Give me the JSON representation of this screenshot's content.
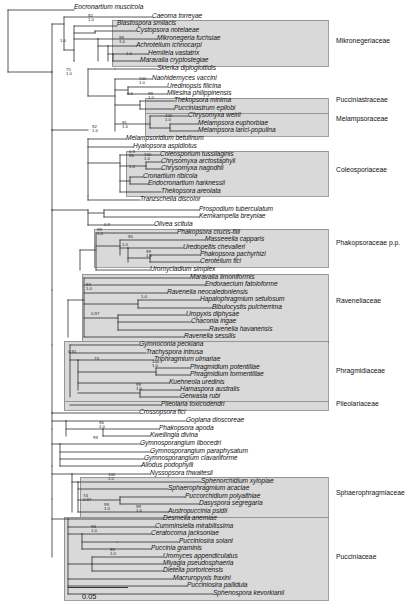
{
  "figure": {
    "type": "phylogenetic-tree",
    "scale_bar": {
      "label": "0.05",
      "length_px": 60
    }
  },
  "taxa": [
    {
      "name": "Eocronartium muscicola",
      "x": 74,
      "y": 8
    },
    {
      "name": "Caeoma torreyae",
      "x": 152,
      "y": 17
    },
    {
      "name": "Blastospora smilacis",
      "x": 117,
      "y": 24
    },
    {
      "name": "Cystopsora notelaeae",
      "x": 136,
      "y": 31
    },
    {
      "name": "Mikronegeria fuchsiae",
      "x": 157,
      "y": 39
    },
    {
      "name": "Achrotelium ichnocarpi",
      "x": 136,
      "y": 46
    },
    {
      "name": "Hemileia vastatrix",
      "x": 148,
      "y": 54
    },
    {
      "name": "Maravalia cryptostegiae",
      "x": 140,
      "y": 61
    },
    {
      "name": "Skierka diploglottidis",
      "x": 157,
      "y": 69
    },
    {
      "name": "Naohidemyces vaccini",
      "x": 152,
      "y": 79
    },
    {
      "name": "Uredinopsis filicina",
      "x": 167,
      "y": 87
    },
    {
      "name": "Milesina philippinensis",
      "x": 167,
      "y": 94
    },
    {
      "name": "Thekopsora minima",
      "x": 174,
      "y": 101
    },
    {
      "name": "Pucciniastrum epilobi",
      "x": 174,
      "y": 109
    },
    {
      "name": "Chrysomyxa weirii",
      "x": 188,
      "y": 116
    },
    {
      "name": "Melampsora euphorbiae",
      "x": 198,
      "y": 124
    },
    {
      "name": "Melampsora larici-populina",
      "x": 198,
      "y": 131
    },
    {
      "name": "Melampsoridium betulinum",
      "x": 126,
      "y": 139
    },
    {
      "name": "Hyalopsora aspidiotus",
      "x": 133,
      "y": 147
    },
    {
      "name": "Coleosporium tussilaginis",
      "x": 160,
      "y": 155
    },
    {
      "name": "Chrysomyxa arctostaphyli",
      "x": 161,
      "y": 162
    },
    {
      "name": "Chrysomyxa nagodhii",
      "x": 161,
      "y": 169
    },
    {
      "name": "Cronartium ribicola",
      "x": 143,
      "y": 177
    },
    {
      "name": "Endocronartium harknessii",
      "x": 148,
      "y": 184
    },
    {
      "name": "Thekopsora areolata",
      "x": 161,
      "y": 192
    },
    {
      "name": "Tranzschelia discolor",
      "x": 140,
      "y": 200
    },
    {
      "name": "Prospodium tuberculatum",
      "x": 199,
      "y": 210
    },
    {
      "name": "Kernkampella breyniae",
      "x": 199,
      "y": 217
    },
    {
      "name": "Olivea scitula",
      "x": 154,
      "y": 225
    },
    {
      "name": "Phakopsora crucis-filii",
      "x": 177,
      "y": 233
    },
    {
      "name": "Masseeella capparis",
      "x": 205,
      "y": 240
    },
    {
      "name": "Uredopeltis chevalieri",
      "x": 183,
      "y": 248
    },
    {
      "name": "Phakopsora pachyrhizi",
      "x": 200,
      "y": 255
    },
    {
      "name": "Cerotelium fici",
      "x": 200,
      "y": 262
    },
    {
      "name": "Uromycladium simplex",
      "x": 150,
      "y": 270
    },
    {
      "name": "Maravalia limoniformis",
      "x": 190,
      "y": 278
    },
    {
      "name": "Endoraecium fatoloforme",
      "x": 205,
      "y": 285
    },
    {
      "name": "Ravenelia neocaledoniensis",
      "x": 167,
      "y": 293
    },
    {
      "name": "Hapalophragmium setulosum",
      "x": 200,
      "y": 300
    },
    {
      "name": "Bibulocystis pulcherrima",
      "x": 212,
      "y": 308
    },
    {
      "name": "Uropyxis diphysae",
      "x": 186,
      "y": 315
    },
    {
      "name": "Chaconia ingae",
      "x": 191,
      "y": 322
    },
    {
      "name": "Ravenelia havanensis",
      "x": 209,
      "y": 330
    },
    {
      "name": "Ravenelia sessilis",
      "x": 184,
      "y": 337
    },
    {
      "name": "Gymnoconia peckiana",
      "x": 139,
      "y": 345
    },
    {
      "name": "Trachyspora intrusa",
      "x": 146,
      "y": 353
    },
    {
      "name": "Triphragmium ulmariae",
      "x": 154,
      "y": 360
    },
    {
      "name": "Phragmidium potentillae",
      "x": 190,
      "y": 368
    },
    {
      "name": "Phragmidium tormentillae",
      "x": 190,
      "y": 375
    },
    {
      "name": "Kuehneola uredinis",
      "x": 169,
      "y": 383
    },
    {
      "name": "Hamaspora australis",
      "x": 180,
      "y": 390
    },
    {
      "name": "Gerwasia rubi",
      "x": 180,
      "y": 397
    },
    {
      "name": "Pileolaria toxicodendri",
      "x": 161,
      "y": 405
    },
    {
      "name": "Crossopsora fici",
      "x": 139,
      "y": 413
    },
    {
      "name": "Goplana dioscoreae",
      "x": 186,
      "y": 421
    },
    {
      "name": "Phakopsora apoda",
      "x": 159,
      "y": 429
    },
    {
      "name": "Kweilingia divina",
      "x": 150,
      "y": 436
    },
    {
      "name": "Gymnosporangium libocedri",
      "x": 140,
      "y": 444
    },
    {
      "name": "Gymnosporangium paraphysatum",
      "x": 150,
      "y": 452
    },
    {
      "name": "Gymnosporangium clavariiforme",
      "x": 144,
      "y": 459
    },
    {
      "name": "Allodus podophylli",
      "x": 141,
      "y": 466
    },
    {
      "name": "Nyssopsora thwaitesii",
      "x": 150,
      "y": 474
    },
    {
      "name": "Sphenorchidium xylopiae",
      "x": 201,
      "y": 482
    },
    {
      "name": "Sphaerophragmium acaciae",
      "x": 168,
      "y": 489
    },
    {
      "name": "Puccorchidium polyalthiae",
      "x": 185,
      "y": 497
    },
    {
      "name": "Dasyspora segregaria",
      "x": 199,
      "y": 504
    },
    {
      "name": "Austropuccinia psidii",
      "x": 168,
      "y": 512
    },
    {
      "name": "Desmella anemiae",
      "x": 163,
      "y": 519
    },
    {
      "name": "Cumminsiella mirabilissima",
      "x": 155,
      "y": 527
    },
    {
      "name": "Ceratocoma jacksoniae",
      "x": 151,
      "y": 534
    },
    {
      "name": "Pucciniosira solani",
      "x": 179,
      "y": 542
    },
    {
      "name": "Puccinia graminis",
      "x": 151,
      "y": 549
    },
    {
      "name": "Uromyces appendiculatus",
      "x": 163,
      "y": 557
    },
    {
      "name": "Miyagia pseudosphaeria",
      "x": 163,
      "y": 564
    },
    {
      "name": "Dietelia portoricensis",
      "x": 163,
      "y": 571
    },
    {
      "name": "Macruropyxis fraxini",
      "x": 173,
      "y": 579
    },
    {
      "name": "Pucciniosira pallidula",
      "x": 187,
      "y": 586
    },
    {
      "name": "Sphenospora kevorkianii",
      "x": 213,
      "y": 594
    }
  ],
  "families": [
    {
      "label": "Mikronegeriaceae",
      "x": 336,
      "y": 41
    },
    {
      "label": "Pucciniastraceae",
      "x": 336,
      "y": 100
    },
    {
      "label": "Melampsoraceae",
      "x": 336,
      "y": 119
    },
    {
      "label": "Coleosporiaceae",
      "x": 336,
      "y": 170
    },
    {
      "label": "Phakopsoraceae p.p.",
      "x": 336,
      "y": 243
    },
    {
      "label": "Raveneliaceae",
      "x": 336,
      "y": 301
    },
    {
      "label": "Phragmidiaceae",
      "x": 336,
      "y": 371
    },
    {
      "label": "Pileolariaceae",
      "x": 336,
      "y": 404
    },
    {
      "label": "Sphaerophragmiaceae",
      "x": 336,
      "y": 493
    },
    {
      "label": "Pucciniaceae",
      "x": 336,
      "y": 557
    }
  ],
  "support_values": [
    {
      "top": "",
      "bottom": "1.0",
      "x": 60,
      "y": 44
    },
    {
      "top": "92",
      "bottom": "1.0",
      "x": 88,
      "y": 19
    },
    {
      "top": "99",
      "bottom": "1.0",
      "x": 119,
      "y": 41
    },
    {
      "top": "",
      "bottom": "1.0",
      "x": 126,
      "y": 57
    },
    {
      "top": "75",
      "bottom": "1.0",
      "x": 66,
      "y": 73
    },
    {
      "top": "100",
      "bottom": "1.0",
      "x": 139,
      "y": 82
    },
    {
      "top": "99",
      "bottom": "1.0",
      "x": 148,
      "y": 97
    },
    {
      "top": "0.6",
      "bottom": "",
      "x": 127,
      "y": 97
    },
    {
      "top": "100",
      "bottom": "1.0",
      "x": 165,
      "y": 119
    },
    {
      "top": "91",
      "bottom": "1.0",
      "x": 122,
      "y": 126
    },
    {
      "top": "92",
      "bottom": "1.0",
      "x": 92,
      "y": 130
    },
    {
      "top": "100",
      "bottom": "1.0",
      "x": 144,
      "y": 158
    },
    {
      "top": "0.9",
      "bottom": "96",
      "x": 129,
      "y": 155
    },
    {
      "top": "",
      "bottom": "1.0",
      "x": 129,
      "y": 170
    },
    {
      "top": "0.9",
      "bottom": "",
      "x": 104,
      "y": 228
    },
    {
      "top": "99",
      "bottom": "1.0",
      "x": 97,
      "y": 233
    },
    {
      "top": "90",
      "bottom": "",
      "x": 128,
      "y": 240
    },
    {
      "top": "1.0",
      "bottom": "",
      "x": 122,
      "y": 248
    },
    {
      "top": "99",
      "bottom": "1.0",
      "x": 146,
      "y": 255
    },
    {
      "top": "83",
      "bottom": "1.0",
      "x": 86,
      "y": 288
    },
    {
      "top": "",
      "bottom": "1.0",
      "x": 141,
      "y": 300
    },
    {
      "top": "0.97",
      "bottom": "",
      "x": 91,
      "y": 317
    },
    {
      "top": "0.91",
      "bottom": "",
      "x": 68,
      "y": 355
    },
    {
      "top": "100",
      "bottom": "1.0",
      "x": 152,
      "y": 365
    },
    {
      "top": "73",
      "bottom": "",
      "x": 94,
      "y": 362
    },
    {
      "top": "99",
      "bottom": "1.0",
      "x": 136,
      "y": 388
    },
    {
      "top": "96",
      "bottom": "1.0",
      "x": 99,
      "y": 426
    },
    {
      "top": "99",
      "bottom": "",
      "x": 93,
      "y": 441
    },
    {
      "top": "100",
      "bottom": "1.0",
      "x": 108,
      "y": 478
    },
    {
      "top": "74",
      "bottom": "0.97",
      "x": 83,
      "y": 499
    },
    {
      "top": "99",
      "bottom": "1.0",
      "x": 104,
      "y": 508
    },
    {
      "top": "99",
      "bottom": "1.0",
      "x": 136,
      "y": 510
    },
    {
      "top": "93",
      "bottom": "1.0",
      "x": 91,
      "y": 530
    },
    {
      "top": "89",
      "bottom": "1.0",
      "x": 110,
      "y": 553
    }
  ],
  "tree_lines": {
    "horizontal": [
      [
        8,
        10,
        74,
        10
      ],
      [
        8,
        10,
        8,
        72
      ],
      [
        8,
        72,
        52,
        72
      ],
      [
        52,
        24,
        52,
        72
      ],
      [
        52,
        24,
        152,
        24
      ],
      [
        64,
        17,
        64,
        50
      ],
      [
        64,
        17,
        152,
        17
      ],
      [
        74,
        26,
        74,
        64
      ],
      [
        74,
        26,
        117,
        26
      ],
      [
        95,
        33,
        95,
        57
      ],
      [
        95,
        33,
        136,
        33
      ],
      [
        108,
        41,
        108,
        49
      ],
      [
        108,
        41,
        157,
        41
      ],
      [
        108,
        49,
        136,
        49
      ],
      [
        113,
        56,
        113,
        64
      ],
      [
        113,
        56,
        148,
        56
      ],
      [
        113,
        64,
        140,
        64
      ],
      [
        52,
        72,
        52,
        130
      ],
      [
        115,
        71,
        115,
        200
      ],
      [
        115,
        71,
        157,
        71
      ],
      [
        52,
        130,
        88,
        130
      ],
      [
        88,
        96,
        88,
        160
      ],
      [
        88,
        96,
        115,
        96
      ],
      [
        128,
        81,
        128,
        111
      ],
      [
        128,
        81,
        152,
        81
      ],
      [
        140,
        89,
        140,
        96
      ],
      [
        140,
        89,
        167,
        89
      ],
      [
        140,
        96,
        167,
        96
      ],
      [
        150,
        103,
        150,
        111
      ],
      [
        150,
        103,
        174,
        103
      ],
      [
        150,
        111,
        174,
        111
      ],
      [
        152,
        118,
        152,
        133
      ],
      [
        152,
        118,
        188,
        118
      ],
      [
        176,
        126,
        176,
        133
      ],
      [
        176,
        126,
        198,
        126
      ],
      [
        176,
        133,
        198,
        133
      ],
      [
        122,
        141,
        122,
        194
      ],
      [
        122,
        141,
        126,
        141
      ],
      [
        122,
        149,
        133,
        149
      ],
      [
        130,
        157,
        130,
        186
      ],
      [
        130,
        157,
        160,
        157
      ],
      [
        146,
        164,
        146,
        171
      ],
      [
        146,
        164,
        161,
        164
      ],
      [
        146,
        171,
        161,
        171
      ],
      [
        126,
        179,
        126,
        186
      ],
      [
        126,
        179,
        143,
        179
      ],
      [
        126,
        186,
        148,
        186
      ],
      [
        122,
        194,
        161,
        194
      ],
      [
        115,
        202,
        140,
        202
      ],
      [
        88,
        212,
        88,
        227
      ],
      [
        88,
        212,
        199,
        212
      ],
      [
        104,
        219,
        104,
        227
      ],
      [
        104,
        219,
        199,
        219
      ],
      [
        104,
        227,
        154,
        227
      ],
      [
        99,
        235,
        99,
        272
      ],
      [
        99,
        235,
        177,
        235
      ],
      [
        120,
        242,
        120,
        264
      ],
      [
        120,
        242,
        205,
        242
      ],
      [
        126,
        250,
        126,
        257
      ],
      [
        126,
        250,
        183,
        250
      ],
      [
        148,
        257,
        148,
        264
      ],
      [
        148,
        257,
        200,
        257
      ],
      [
        148,
        264,
        200,
        264
      ],
      [
        99,
        272,
        150,
        272
      ],
      [
        86,
        290,
        86,
        339
      ],
      [
        86,
        290,
        190,
        290
      ],
      [
        96,
        297,
        96,
        332
      ],
      [
        96,
        297,
        205,
        297
      ],
      [
        112,
        302,
        112,
        310
      ],
      [
        112,
        302,
        167,
        302
      ],
      [
        138,
        310,
        138,
        317
      ],
      [
        138,
        310,
        200,
        310
      ],
      [
        138,
        317,
        212,
        317
      ],
      [
        120,
        324,
        120,
        332
      ],
      [
        120,
        324,
        186,
        324
      ],
      [
        136,
        331,
        136,
        339
      ],
      [
        136,
        331,
        191,
        331
      ],
      [
        152,
        339,
        152,
        346
      ],
      [
        152,
        339,
        209,
        339
      ],
      [
        86,
        346,
        184,
        346
      ]
    ]
  }
}
